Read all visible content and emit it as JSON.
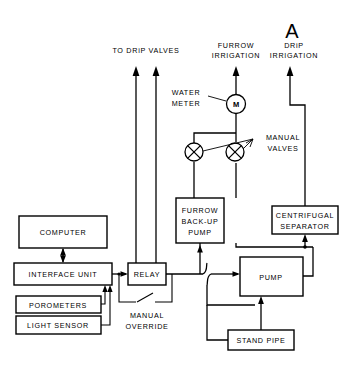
{
  "figure": {
    "panel_label": "A",
    "top_outputs": [
      {
        "name": "to-drip-valves",
        "label": "TO DRiP VALVES"
      },
      {
        "name": "furrow-irrigation",
        "label_line1": "FURROW",
        "label_line2": "IRRIGATION"
      },
      {
        "name": "drip-irrigation",
        "label_line1": "DRiP",
        "label_line2": "IRRIGATION"
      }
    ],
    "annotations": {
      "water_meter_line1": "WATER",
      "water_meter_line2": "METER",
      "water_meter_symbol": "M",
      "manual_valves_line1": "MANUAL",
      "manual_valves_line2": "VALVES",
      "manual_override_line1": "MANUAL",
      "manual_override_line2": "OVERRIDE"
    },
    "boxes": [
      {
        "name": "computer",
        "label": "COMPUTER"
      },
      {
        "name": "interface-unit",
        "label": "INTERFACE UNIT"
      },
      {
        "name": "porometers",
        "label": "POROMETERS"
      },
      {
        "name": "light-sensor",
        "label": "LIGHT SENSOR"
      },
      {
        "name": "relay",
        "label": "RELAY"
      },
      {
        "name": "furrow-backup-pump",
        "label_line1": "FURROW",
        "label_line2": "BACK-UP",
        "label_line3": "PUMP"
      },
      {
        "name": "centrifugal-separator",
        "label_line1": "CENTRIFUGAL",
        "label_line2": "SEPARATOR"
      },
      {
        "name": "pump",
        "label": "PUMP"
      },
      {
        "name": "stand-pipe",
        "label": "STAND PIPE"
      }
    ],
    "colors": {
      "ink": "#000000",
      "paper": "#ffffff"
    }
  }
}
